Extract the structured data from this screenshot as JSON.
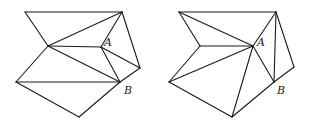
{
  "figures": [
    {
      "id": "left",
      "labels": {
        "A": "A",
        "B": "B"
      },
      "vertices": {
        "P1": [
          25,
          12
        ],
        "P2": [
          122,
          12
        ],
        "P3": [
          48,
          46
        ],
        "A": [
          101,
          47
        ],
        "P5": [
          140,
          68
        ],
        "B": [
          120,
          82
        ],
        "P7": [
          16,
          82
        ],
        "P8": [
          79,
          117
        ]
      },
      "edges": [
        [
          "P1",
          "P2"
        ],
        [
          "P1",
          "P3"
        ],
        [
          "P2",
          "P3"
        ],
        [
          "P2",
          "A"
        ],
        [
          "P2",
          "P5"
        ],
        [
          "P3",
          "A"
        ],
        [
          "P3",
          "B"
        ],
        [
          "P3",
          "P7"
        ],
        [
          "A",
          "B"
        ],
        [
          "A",
          "P5"
        ],
        [
          "P5",
          "B"
        ],
        [
          "P7",
          "B"
        ],
        [
          "P7",
          "P8"
        ],
        [
          "P8",
          "B"
        ]
      ],
      "label_positions": {
        "A": [
          104,
          46
        ],
        "B": [
          124,
          94
        ]
      }
    },
    {
      "id": "right",
      "labels": {
        "A": "A",
        "B": "B"
      },
      "vertices": {
        "Q1": [
          179,
          12
        ],
        "Q2": [
          276,
          12
        ],
        "Q3": [
          200,
          46
        ],
        "A": [
          253,
          46
        ],
        "Q5": [
          294,
          67
        ],
        "B": [
          274,
          82
        ],
        "Q7": [
          169,
          82
        ],
        "Q8": [
          232,
          117
        ]
      },
      "edges": [
        [
          "Q1",
          "Q2"
        ],
        [
          "Q1",
          "Q3"
        ],
        [
          "Q1",
          "A"
        ],
        [
          "Q2",
          "A"
        ],
        [
          "Q2",
          "B"
        ],
        [
          "Q2",
          "Q5"
        ],
        [
          "Q3",
          "A"
        ],
        [
          "Q3",
          "Q7"
        ],
        [
          "Q7",
          "A"
        ],
        [
          "A",
          "Q8"
        ],
        [
          "A",
          "B"
        ],
        [
          "Q5",
          "B"
        ],
        [
          "Q7",
          "Q8"
        ],
        [
          "Q8",
          "B"
        ]
      ],
      "label_positions": {
        "A": [
          257,
          46
        ],
        "B": [
          277,
          94
        ]
      }
    }
  ]
}
